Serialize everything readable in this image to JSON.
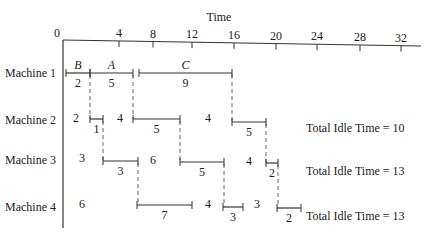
{
  "title": "Time",
  "axis": {
    "origin_label": "0",
    "ticks": [
      {
        "label": "4",
        "x": 119
      },
      {
        "label": "8",
        "x": 153
      },
      {
        "label": "12",
        "x": 192
      },
      {
        "label": "16",
        "x": 234
      },
      {
        "label": "20",
        "x": 276
      },
      {
        "label": "24",
        "x": 317
      },
      {
        "label": "28",
        "x": 360
      },
      {
        "label": "32",
        "x": 401
      }
    ]
  },
  "machines": [
    {
      "label": "Machine 1",
      "y": 73
    },
    {
      "label": "Machine 2",
      "y": 120
    },
    {
      "label": "Machine 3",
      "y": 160
    },
    {
      "label": "Machine 4",
      "y": 207
    }
  ],
  "segments": [
    {
      "machine": 1,
      "x1": 66,
      "x2": 90,
      "y": 73,
      "job": "B",
      "duration": "2",
      "end_tick_left": true
    },
    {
      "machine": 1,
      "x1": 90,
      "x2": 133,
      "y": 73,
      "job": "A",
      "duration": "5"
    },
    {
      "machine": 1,
      "x1": 139,
      "x2": 232,
      "y": 73,
      "job": "C",
      "duration": "9"
    },
    {
      "machine": 2,
      "x1": 90,
      "x2": 103,
      "y": 119,
      "duration": "1"
    },
    {
      "machine": 2,
      "x1": 133,
      "x2": 180,
      "y": 119,
      "duration": "5"
    },
    {
      "machine": 2,
      "x1": 232,
      "x2": 266,
      "y": 122,
      "duration": "5"
    },
    {
      "machine": 3,
      "x1": 103,
      "x2": 138,
      "y": 161,
      "duration": "3"
    },
    {
      "machine": 3,
      "x1": 180,
      "x2": 224,
      "y": 162,
      "duration": "5"
    },
    {
      "machine": 3,
      "x1": 266,
      "x2": 278,
      "y": 163,
      "duration": "2"
    },
    {
      "machine": 4,
      "x1": 137,
      "x2": 192,
      "y": 205,
      "duration": "7"
    },
    {
      "machine": 4,
      "x1": 223,
      "x2": 243,
      "y": 207,
      "duration": "3"
    },
    {
      "machine": 4,
      "x1": 277,
      "x2": 301,
      "y": 208,
      "duration": "2"
    }
  ],
  "idle_labels": [
    {
      "machine": 2,
      "value": "2",
      "x": 76,
      "y": 122
    },
    {
      "machine": 2,
      "value": "4",
      "x": 120,
      "y": 122
    },
    {
      "machine": 2,
      "value": "4",
      "x": 208,
      "y": 122
    },
    {
      "machine": 3,
      "value": "3",
      "x": 82,
      "y": 162
    },
    {
      "machine": 3,
      "value": "6",
      "x": 153,
      "y": 164
    },
    {
      "machine": 3,
      "value": "4",
      "x": 249,
      "y": 165
    },
    {
      "machine": 4,
      "value": "6",
      "x": 82,
      "y": 208
    },
    {
      "machine": 4,
      "value": "4",
      "x": 208,
      "y": 208
    },
    {
      "machine": 4,
      "value": "3",
      "x": 257,
      "y": 208
    }
  ],
  "dashed_connectors": [
    {
      "x": 90,
      "y1": 75,
      "y2": 119
    },
    {
      "x": 133,
      "y1": 75,
      "y2": 119
    },
    {
      "x": 232,
      "y1": 75,
      "y2": 122
    },
    {
      "x": 103,
      "y1": 121,
      "y2": 161
    },
    {
      "x": 180,
      "y1": 121,
      "y2": 162
    },
    {
      "x": 266,
      "y1": 124,
      "y2": 163
    },
    {
      "x": 138,
      "y1": 163,
      "y2": 205
    },
    {
      "x": 224,
      "y1": 164,
      "y2": 207
    },
    {
      "x": 278,
      "y1": 165,
      "y2": 208
    }
  ],
  "totals": [
    {
      "machine": 2,
      "text": "Total Idle Time = 10",
      "x": 306,
      "y": 132
    },
    {
      "machine": 3,
      "text": "Total Idle Time = 13",
      "x": 306,
      "y": 175
    },
    {
      "machine": 4,
      "text": "Total Idle Time = 13",
      "x": 306,
      "y": 220
    }
  ]
}
